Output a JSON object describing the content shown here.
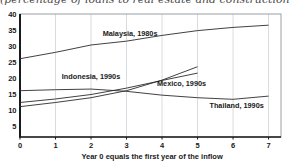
{
  "chart_data": {
    "type": "line",
    "title": "(percentage of loans to real estate and construction)",
    "xlabel": "Year 0 equals the first year of the inflow",
    "x_ticks": [
      0,
      1,
      2,
      3,
      4,
      5,
      6,
      7
    ],
    "y_ticks": [
      5,
      10,
      15,
      20,
      25,
      30,
      35,
      40
    ],
    "xlim": [
      0,
      7.35
    ],
    "ylim": [
      1.5,
      40
    ],
    "grid": "vertical-only",
    "legend_position": "inline-labels",
    "line_color": "#2b2b2b",
    "grid_color": "#cdd2d8",
    "frame_color": "#9aa0a6",
    "series": [
      {
        "name": "Malaysia, 1980s",
        "x": [
          0,
          1,
          2,
          3,
          4,
          5,
          6,
          7
        ],
        "values": [
          26,
          28,
          30.3,
          31.5,
          33.3,
          34.8,
          35.8,
          36.5
        ],
        "label_pos": {
          "x": 3.1,
          "y": 33.2
        }
      },
      {
        "name": "Indonesia, 1990s",
        "x": [
          0,
          1,
          2,
          3,
          4,
          5
        ],
        "values": [
          12.3,
          13.4,
          14.8,
          16.8,
          19.2,
          21.5
        ],
        "label_pos": {
          "x": 2.0,
          "y": 19.6
        }
      },
      {
        "name": "Mexico, 1990s",
        "x": [
          0,
          1,
          2,
          3,
          4,
          5
        ],
        "values": [
          11,
          12.3,
          13.8,
          16,
          19.3,
          23.5
        ],
        "label_pos": {
          "x": 4.55,
          "y": 17.4
        }
      },
      {
        "name": "Thailand, 1990s",
        "x": [
          0,
          1,
          2,
          3,
          4,
          5,
          6,
          7
        ],
        "values": [
          16,
          16.3,
          16.5,
          15.8,
          14.6,
          13.8,
          13.3,
          14.3
        ],
        "label_pos": {
          "x": 6.1,
          "y": 10.6
        }
      }
    ]
  }
}
